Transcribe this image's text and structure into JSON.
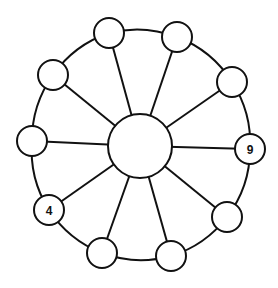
{
  "diagram": {
    "type": "wheel-graph",
    "stroke_color": "#111111",
    "background": "#ffffff",
    "hub": {
      "cx": 140,
      "cy": 146,
      "r": 32,
      "label": ""
    },
    "ring": {
      "cx": 140,
      "cy": 146,
      "r": 112
    },
    "node_radius": 15,
    "nodes": [
      {
        "id": 1,
        "cx": 109,
        "cy": 33,
        "label": ""
      },
      {
        "id": 2,
        "cx": 177,
        "cy": 37,
        "label": ""
      },
      {
        "id": 3,
        "cx": 232,
        "cy": 82,
        "label": ""
      },
      {
        "id": 4,
        "cx": 250,
        "cy": 149,
        "label": "9"
      },
      {
        "id": 5,
        "cx": 227,
        "cy": 217,
        "label": ""
      },
      {
        "id": 6,
        "cx": 171,
        "cy": 256,
        "label": ""
      },
      {
        "id": 7,
        "cx": 102,
        "cy": 253,
        "label": ""
      },
      {
        "id": 8,
        "cx": 49,
        "cy": 210,
        "label": "4"
      },
      {
        "id": 9,
        "cx": 32,
        "cy": 141,
        "label": ""
      },
      {
        "id": 10,
        "cx": 53,
        "cy": 75,
        "label": ""
      }
    ]
  }
}
